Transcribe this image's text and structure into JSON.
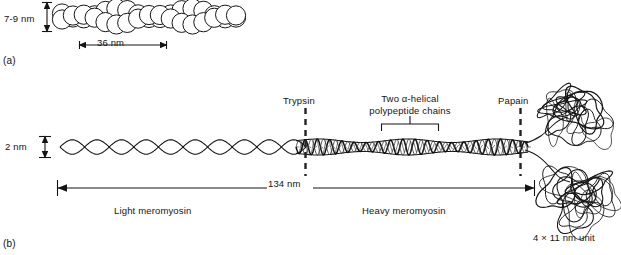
{
  "figure": {
    "panels": [
      {
        "key": "a",
        "label": "(a)",
        "subject": "actin-filament",
        "annotations": {
          "diameter": "7-9 nm",
          "repeat": "36 nm"
        }
      },
      {
        "key": "b",
        "label": "(b)",
        "subject": "myosin-molecule",
        "annotations": {
          "thickness": "2 nm",
          "length": "134 nm",
          "cleavage_site_1": "Trypsin",
          "cleavage_site_2": "Papain",
          "coiled_coil": "Two  α-helical\npolypeptide chains",
          "coiled_coil_line1": "Two  α-helical",
          "coiled_coil_line2": "polypeptide chains",
          "fragment_left": "Light  meromyosin",
          "fragment_right": "Heavy  meromyosin",
          "head_unit": "4 × 11 nm unit"
        }
      }
    ]
  },
  "colors": {
    "ink": "#141414",
    "line": "#1a1a1a",
    "paper": "#ffffff",
    "dash": "#2a2a2a"
  },
  "chart_data": {
    "type": "diagram",
    "panels": [
      {
        "id": "a",
        "name": "Actin filament (F-actin)",
        "description": "Double helix of globular G-actin subunits drawn as overlapping circles",
        "measurements": [
          {
            "label": "7-9 nm",
            "quantity": "filament diameter",
            "orientation": "vertical"
          },
          {
            "label": "36 nm",
            "quantity": "helical repeat",
            "orientation": "horizontal"
          }
        ],
        "subunit_count": 34,
        "strands": 2
      },
      {
        "id": "b",
        "name": "Myosin II molecule",
        "description": "Two-stranded alpha-helical coiled-coil tail terminating in two globular heads, with protease cleavage sites",
        "measurements": [
          {
            "label": "2 nm",
            "quantity": "tail diameter",
            "orientation": "vertical"
          },
          {
            "label": "134 nm",
            "quantity": "overall length",
            "orientation": "horizontal"
          },
          {
            "label": "4 × 11 nm unit",
            "quantity": "globular head dimensions",
            "orientation": "caption"
          }
        ],
        "cleavage_sites": [
          {
            "enzyme": "Trypsin",
            "position_fraction": 0.52,
            "style": "dashed-vertical"
          },
          {
            "enzyme": "Papain",
            "position_fraction": 0.97,
            "style": "dashed-vertical"
          }
        ],
        "fragments": [
          {
            "label": "Light  meromyosin",
            "span": "N-terminal tail to trypsin site"
          },
          {
            "label": "Heavy  meromyosin",
            "span": "trypsin site to C-terminal heads"
          }
        ],
        "callouts": [
          {
            "label": "Two  α-helical polypeptide chains",
            "target": "coiled-coil region between cleavage sites"
          }
        ],
        "heads": 2
      }
    ]
  }
}
